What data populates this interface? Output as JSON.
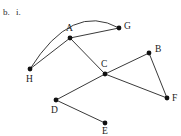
{
  "figure": {
    "part_label": "b.",
    "item_label": "i.",
    "cut_off_header_text": "",
    "colors": {
      "background": "#ffffff",
      "edge": "#3a3a3a",
      "vertex": "#111111",
      "label": "#1a1a1a"
    }
  },
  "chart_data": {
    "type": "diagram",
    "title": "",
    "graph_kind": "undirected graph",
    "vertices": [
      {
        "id": "A",
        "label": "A",
        "x": 70,
        "y": 38,
        "label_x": 66,
        "label_y": 31
      },
      {
        "id": "B",
        "label": "B",
        "x": 149,
        "y": 53,
        "label_x": 155,
        "label_y": 52
      },
      {
        "id": "C",
        "label": "C",
        "x": 105,
        "y": 74,
        "label_x": 101,
        "label_y": 67
      },
      {
        "id": "D",
        "label": "D",
        "x": 56,
        "y": 100,
        "label_x": 51,
        "label_y": 113
      },
      {
        "id": "E",
        "label": "E",
        "x": 105,
        "y": 123,
        "label_x": 102,
        "label_y": 134
      },
      {
        "id": "F",
        "label": "F",
        "x": 167,
        "y": 98,
        "label_x": 172,
        "label_y": 101
      },
      {
        "id": "G",
        "label": "G",
        "x": 119,
        "y": 28,
        "label_x": 124,
        "label_y": 29
      },
      {
        "id": "H",
        "label": "H",
        "x": 30,
        "y": 69,
        "label_x": 26,
        "label_y": 82
      }
    ],
    "edges": [
      {
        "from": "A",
        "to": "G",
        "style": "straight"
      },
      {
        "from": "A",
        "to": "H",
        "style": "straight"
      },
      {
        "from": "A",
        "to": "C",
        "style": "straight"
      },
      {
        "from": "C",
        "to": "B",
        "style": "straight"
      },
      {
        "from": "C",
        "to": "F",
        "style": "straight"
      },
      {
        "from": "C",
        "to": "D",
        "style": "straight"
      },
      {
        "from": "B",
        "to": "F",
        "style": "straight"
      },
      {
        "from": "D",
        "to": "E",
        "style": "straight"
      },
      {
        "from": "H",
        "to": "G",
        "style": "curved-arc",
        "arc_control_x": 72,
        "arc_control_y": 2
      }
    ],
    "vertex_count": 8,
    "edge_count": 9,
    "xlabel": "",
    "ylabel": "",
    "grid": false,
    "legend": null
  }
}
